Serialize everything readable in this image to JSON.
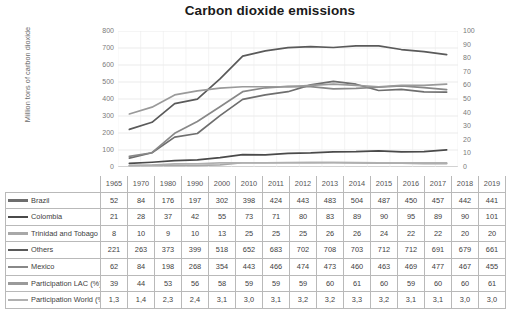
{
  "chart_data": {
    "type": "line",
    "title": "Carbon dioxide emissions",
    "xlabel": "",
    "ylabel": "Million tons of carbon dioxide",
    "y2label": "",
    "ylim": [
      0,
      800
    ],
    "y2lim": [
      0,
      100
    ],
    "grid": true,
    "legend_position": "left-table",
    "categories": [
      "1965",
      "1970",
      "1980",
      "1990",
      "2000",
      "2010",
      "2011",
      "2012",
      "2013",
      "2014",
      "2015",
      "2016",
      "2017",
      "2018",
      "2019"
    ],
    "yticks": [
      "0",
      "100",
      "200",
      "300",
      "400",
      "500",
      "600",
      "700",
      "800"
    ],
    "y2ticks": [
      "0",
      "10",
      "20",
      "30",
      "40",
      "50",
      "60",
      "70",
      "80",
      "90",
      "100"
    ],
    "series": [
      {
        "name": "Brazil",
        "axis": "left",
        "color": "#6e6e6e",
        "values": [
          52,
          84,
          176,
          197,
          302,
          398,
          424,
          443,
          483,
          504,
          487,
          450,
          457,
          442,
          441
        ]
      },
      {
        "name": "Colombia",
        "axis": "left",
        "color": "#4a4a4a",
        "values": [
          21,
          28,
          37,
          42,
          55,
          73,
          71,
          80,
          83,
          89,
          90,
          95,
          89,
          90,
          101
        ]
      },
      {
        "name": "Trinidad and Tobago",
        "axis": "left",
        "color": "#a8a8a8",
        "values": [
          8,
          10,
          9,
          10,
          13,
          25,
          25,
          25,
          26,
          26,
          24,
          22,
          22,
          20,
          20
        ]
      },
      {
        "name": "Others",
        "axis": "left",
        "color": "#5a5a5a",
        "values": [
          221,
          263,
          373,
          399,
          518,
          652,
          683,
          702,
          708,
          703,
          712,
          712,
          691,
          679,
          661
        ]
      },
      {
        "name": "Mexico",
        "axis": "left",
        "color": "#888888",
        "values": [
          62,
          84,
          198,
          268,
          354,
          443,
          466,
          474,
          473,
          460,
          463,
          469,
          477,
          467,
          455
        ]
      },
      {
        "name": "Participation LAC (%)",
        "axis": "right",
        "color": "#9a9a9a",
        "values": [
          39,
          44,
          53,
          56,
          58,
          59,
          59,
          59,
          60,
          61,
          60,
          59,
          60,
          60,
          61
        ]
      },
      {
        "name": "Participation World (%)",
        "axis": "right",
        "color": "#b0b0b0",
        "values": [
          1.3,
          1.4,
          2.3,
          2.4,
          3.1,
          3.0,
          3.1,
          3.2,
          3.2,
          3.3,
          3.2,
          3.1,
          3.1,
          3.0,
          3.0
        ]
      }
    ]
  },
  "table": {
    "years": [
      "1965",
      "1970",
      "1980",
      "1990",
      "2000",
      "2010",
      "2011",
      "2012",
      "2013",
      "2014",
      "2015",
      "2016",
      "2017",
      "2018",
      "2019"
    ],
    "rows": [
      {
        "label": "Brazil",
        "color": "#6e6e6e",
        "cells": [
          "52",
          "84",
          "176",
          "197",
          "302",
          "398",
          "424",
          "443",
          "483",
          "504",
          "487",
          "450",
          "457",
          "442",
          "441"
        ]
      },
      {
        "label": "Colombia",
        "color": "#4a4a4a",
        "cells": [
          "21",
          "28",
          "37",
          "42",
          "55",
          "73",
          "71",
          "80",
          "83",
          "89",
          "90",
          "95",
          "89",
          "90",
          "101"
        ]
      },
      {
        "label": "Trinidad and Tobago",
        "color": "#a8a8a8",
        "cells": [
          "8",
          "10",
          "9",
          "10",
          "13",
          "25",
          "25",
          "25",
          "26",
          "26",
          "24",
          "22",
          "22",
          "20",
          "20"
        ]
      },
      {
        "label": "Others",
        "color": "#5a5a5a",
        "cells": [
          "221",
          "263",
          "373",
          "399",
          "518",
          "652",
          "683",
          "702",
          "708",
          "703",
          "712",
          "712",
          "691",
          "679",
          "661"
        ]
      },
      {
        "label": "Mexico",
        "color": "#888888",
        "cells": [
          "62",
          "84",
          "198",
          "268",
          "354",
          "443",
          "466",
          "474",
          "473",
          "460",
          "463",
          "469",
          "477",
          "467",
          "455"
        ]
      },
      {
        "label": "Participation LAC (%)",
        "color": "#9a9a9a",
        "cells": [
          "39",
          "44",
          "53",
          "56",
          "58",
          "59",
          "59",
          "59",
          "60",
          "61",
          "60",
          "59",
          "60",
          "60",
          "61"
        ]
      },
      {
        "label": "Participation World (%)",
        "color": "#b0b0b0",
        "cells": [
          "1,3",
          "1,4",
          "2,3",
          "2,4",
          "3,1",
          "3,0",
          "3,1",
          "3,2",
          "3,2",
          "3,3",
          "3,2",
          "3,1",
          "3,1",
          "3,0",
          "3,0"
        ]
      }
    ]
  }
}
